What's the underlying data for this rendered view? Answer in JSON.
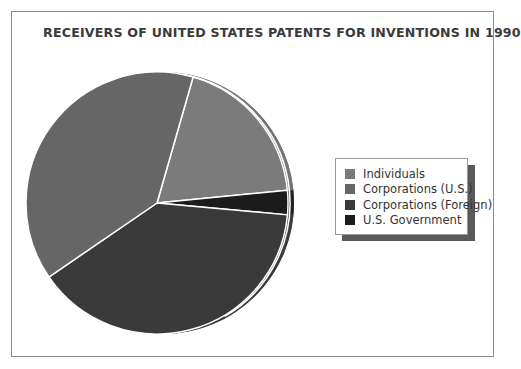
{
  "chart_data": {
    "type": "pie",
    "title": "RECEIVERS OF UNITED STATES PATENTS FOR INVENTIONS IN 1990",
    "categories": [
      "Individuals",
      "U.S. Government",
      "Corporations (Foreign)",
      "Corporations (U.S.)"
    ],
    "values": [
      19,
      3,
      39,
      39
    ],
    "units": "percent (estimated from slice angles)",
    "start_angle_deg": 16,
    "direction": "clockwise",
    "colors": {
      "Individuals": "#7b7b7b",
      "Corporations (U.S.)": "#666666",
      "Corporations (Foreign)": "#3a3a3a",
      "U.S. Government": "#1c1c1c"
    },
    "legend_position": "right",
    "legend_entries": [
      "Individuals",
      "Corporations (U.S.)",
      "Corporations (Foreign)",
      "U.S. Government"
    ],
    "style": "3D pie with offset white outline"
  },
  "title": "RECEIVERS OF UNITED STATES PATENTS FOR INVENTIONS IN 1990",
  "legend": {
    "items": [
      {
        "label": "Individuals",
        "color": "#7b7b7b"
      },
      {
        "label": "Corporations (U.S.)",
        "color": "#666666"
      },
      {
        "label": "Corporations (Foreign)",
        "color": "#3a3a3a"
      },
      {
        "label": "U.S. Government",
        "color": "#1c1c1c"
      }
    ]
  }
}
